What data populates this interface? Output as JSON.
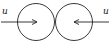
{
  "diagram": {
    "left_ball": {
      "velocity_label": "u",
      "direction": "right"
    },
    "right_ball": {
      "velocity_label": "u",
      "direction": "left"
    },
    "colors": {
      "stroke": "#222222",
      "background": "#ffffff"
    }
  }
}
